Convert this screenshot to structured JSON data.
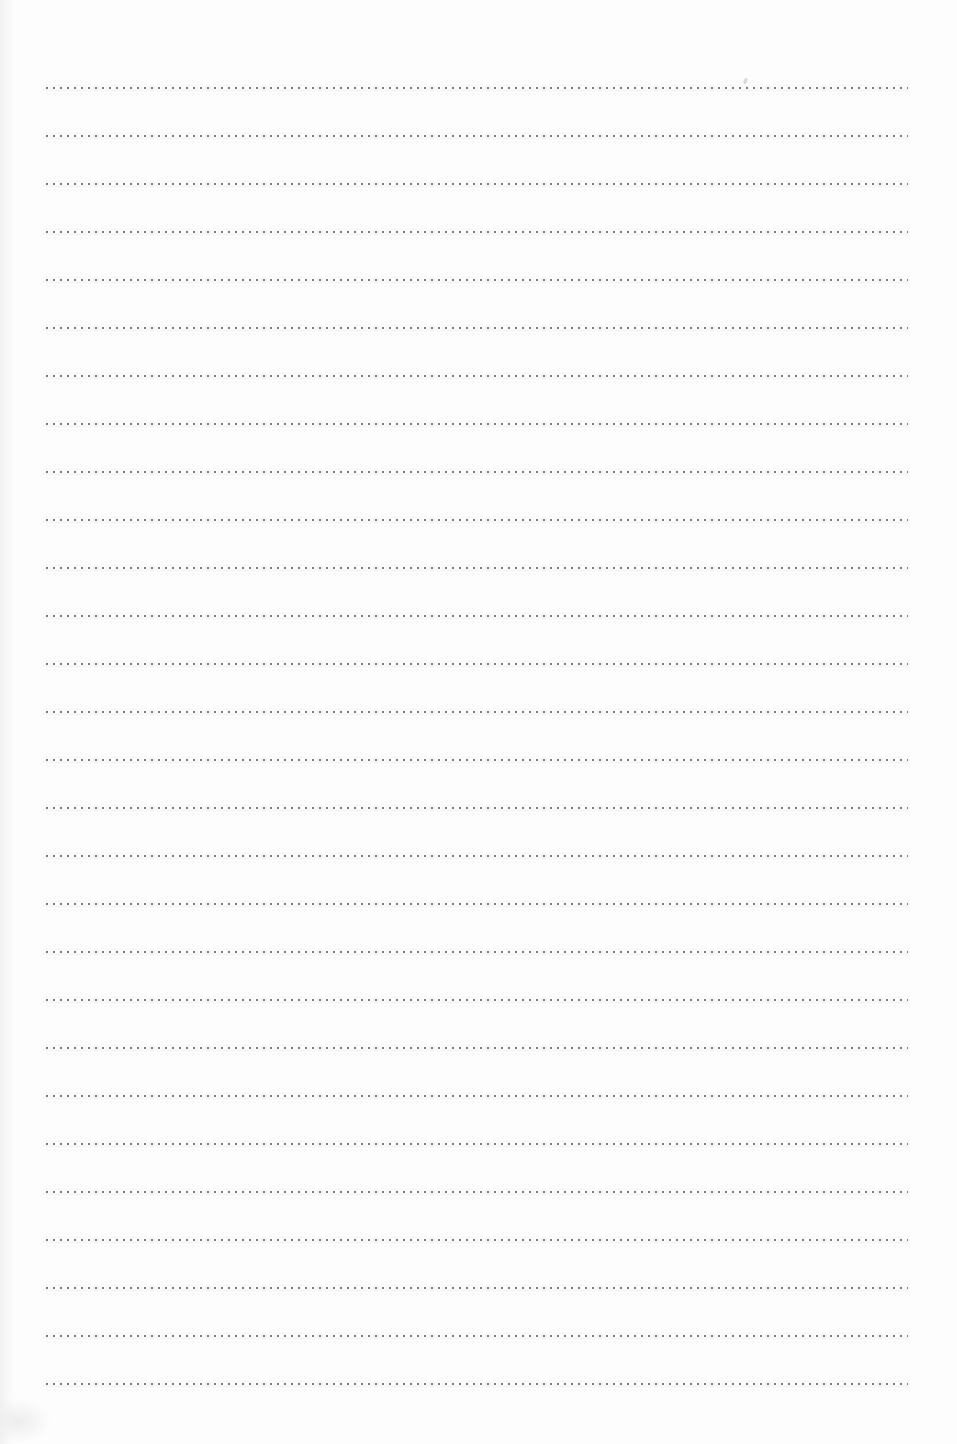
{
  "page": {
    "kind": "blank-dotted-ruled-page",
    "background_color": "#fdfdfd",
    "dot_color": "#7b7b7b",
    "line_count": 28,
    "first_line_top_px": 87,
    "line_spacing_px": 48,
    "line_left_px": 46,
    "line_width_px": 862,
    "text_content": ""
  }
}
